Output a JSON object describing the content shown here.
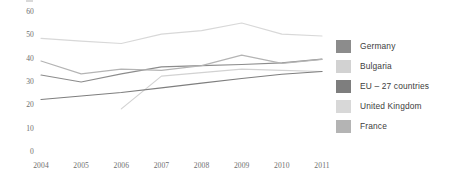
{
  "chart_data": {
    "type": "line",
    "title": "",
    "xlabel": "",
    "ylabel": "",
    "xlim": [
      2004,
      2011
    ],
    "ylim": [
      0,
      60
    ],
    "yticks": [
      0,
      10,
      20,
      30,
      40,
      50,
      60
    ],
    "xticks": [
      2004,
      2005,
      2006,
      2007,
      2008,
      2009,
      2010,
      2011
    ],
    "grid": false,
    "legend_position": "right",
    "x": [
      2004,
      2005,
      2006,
      2007,
      2008,
      2009,
      2010,
      2011
    ],
    "series": [
      {
        "name": "Germany",
        "color": "#8c8c8c",
        "values": [
          33.0,
          30.0,
          33.5,
          36.5,
          37.0,
          37.5,
          38.2,
          39.8
        ]
      },
      {
        "name": "Bulgaria",
        "color": "#d2d2d2",
        "x": [
          2006,
          2007,
          2008,
          2009,
          2010,
          2011
        ],
        "values": [
          18.5,
          32.5,
          34.0,
          35.5,
          35.0,
          34.5
        ]
      },
      {
        "name": "EU – 27 countries",
        "color": "#7e7e7e",
        "values": [
          22.5,
          24.0,
          25.5,
          27.5,
          29.5,
          31.5,
          33.3,
          34.5
        ]
      },
      {
        "name": "United Kingdom",
        "color": "#d8d8d8",
        "values": [
          48.7,
          47.5,
          46.5,
          50.5,
          52.0,
          55.3,
          50.5,
          49.7
        ]
      },
      {
        "name": "France",
        "color": "#b4b4b4",
        "values": [
          39.0,
          33.5,
          35.5,
          35.0,
          37.0,
          41.5,
          38.0,
          39.7
        ]
      }
    ]
  },
  "axes": {
    "y_tick_labels": [
      "60",
      "50",
      "40",
      "30",
      "20",
      "10",
      "0"
    ],
    "x_tick_labels": [
      "2004",
      "2005",
      "2006",
      "2007",
      "2008",
      "2009",
      "2010",
      "2011"
    ]
  },
  "legend": {
    "items": [
      {
        "label": "Germany",
        "color": "#8c8c8c"
      },
      {
        "label": "Bulgaria",
        "color": "#d2d2d2"
      },
      {
        "label": "EU – 27 countries",
        "color": "#7e7e7e"
      },
      {
        "label": "United Kingdom",
        "color": "#d8d8d8"
      },
      {
        "label": "France",
        "color": "#b4b4b4"
      }
    ]
  }
}
